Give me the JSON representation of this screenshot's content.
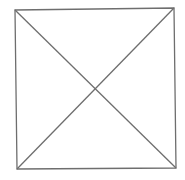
{
  "diagram": {
    "type": "square-with-diagonals",
    "background": "#ffffff",
    "stroke_color": "#6e6e6e",
    "stroke_width": 1.3,
    "corners": {
      "top_left": [
        15,
        10
      ],
      "top_right": [
        174,
        8
      ],
      "bottom_right": [
        176,
        168
      ],
      "bottom_left": [
        17,
        169
      ]
    },
    "intersection": [
      95,
      89
    ]
  }
}
